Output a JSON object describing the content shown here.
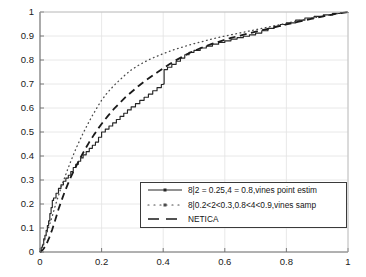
{
  "chart_data": {
    "type": "line",
    "title": "",
    "xlabel": "",
    "ylabel": "",
    "xlim": [
      0,
      1
    ],
    "ylim": [
      0,
      1
    ],
    "grid": true,
    "legend_position": "lower-right",
    "xticks": [
      "0",
      "0.2",
      "0.4",
      "0.6",
      "0.8",
      "1"
    ],
    "xtick_values": [
      0,
      0.2,
      0.4,
      0.6,
      0.8,
      1
    ],
    "yticks": [
      "0",
      "0.1",
      "0.2",
      "0.3",
      "0.4",
      "0.5",
      "0.6",
      "0.7",
      "0.8",
      "0.9",
      "1"
    ],
    "ytick_values": [
      0,
      0.1,
      0.2,
      0.3,
      0.4,
      0.5,
      0.6,
      0.7,
      0.8,
      0.9,
      1
    ],
    "series": [
      {
        "name": "8|2 = 0.25,4 = 0.8,vines point estim",
        "style": "solid",
        "color": "#262626",
        "marker": "dot",
        "x": [
          0.0,
          0.004,
          0.008,
          0.012,
          0.016,
          0.02,
          0.024,
          0.028,
          0.032,
          0.036,
          0.04,
          0.044,
          0.052,
          0.06,
          0.068,
          0.076,
          0.084,
          0.092,
          0.1,
          0.108,
          0.116,
          0.124,
          0.132,
          0.14,
          0.15,
          0.16,
          0.17,
          0.18,
          0.19,
          0.2,
          0.212,
          0.224,
          0.236,
          0.248,
          0.26,
          0.272,
          0.284,
          0.296,
          0.31,
          0.324,
          0.338,
          0.352,
          0.366,
          0.38,
          0.394,
          0.4,
          0.403,
          0.414,
          0.428,
          0.442,
          0.456,
          0.47,
          0.484,
          0.5,
          0.52,
          0.54,
          0.56,
          0.58,
          0.6,
          0.62,
          0.64,
          0.66,
          0.68,
          0.7,
          0.72,
          0.74,
          0.76,
          0.78,
          0.8,
          0.83,
          0.86,
          0.89,
          0.92,
          0.95,
          0.975,
          1.0
        ],
        "y": [
          0.0,
          0.02,
          0.03,
          0.055,
          0.07,
          0.09,
          0.11,
          0.13,
          0.16,
          0.185,
          0.215,
          0.225,
          0.245,
          0.265,
          0.28,
          0.295,
          0.308,
          0.32,
          0.335,
          0.352,
          0.365,
          0.378,
          0.392,
          0.405,
          0.418,
          0.432,
          0.445,
          0.458,
          0.478,
          0.5,
          0.512,
          0.525,
          0.538,
          0.552,
          0.565,
          0.578,
          0.592,
          0.605,
          0.618,
          0.632,
          0.645,
          0.658,
          0.672,
          0.685,
          0.698,
          0.7,
          0.76,
          0.77,
          0.782,
          0.795,
          0.808,
          0.822,
          0.832,
          0.84,
          0.85,
          0.858,
          0.866,
          0.873,
          0.88,
          0.887,
          0.893,
          0.899,
          0.905,
          0.912,
          0.922,
          0.932,
          0.94,
          0.948,
          0.955,
          0.966,
          0.975,
          0.982,
          0.988,
          0.994,
          0.998,
          1.0
        ]
      },
      {
        "name": "8|0.2<2<0.3,0.8<4<0.9,vines samp",
        "style": "dotted",
        "color": "#4a4a4a",
        "x": [
          0.0,
          0.01,
          0.02,
          0.03,
          0.04,
          0.05,
          0.06,
          0.07,
          0.08,
          0.09,
          0.1,
          0.11,
          0.12,
          0.13,
          0.14,
          0.15,
          0.16,
          0.17,
          0.18,
          0.19,
          0.2,
          0.215,
          0.23,
          0.245,
          0.26,
          0.28,
          0.3,
          0.32,
          0.34,
          0.36,
          0.38,
          0.4,
          0.42,
          0.44,
          0.46,
          0.48,
          0.5,
          0.53,
          0.56,
          0.59,
          0.62,
          0.65,
          0.68,
          0.71,
          0.74,
          0.77,
          0.8,
          0.84,
          0.88,
          0.92,
          0.96,
          1.0
        ],
        "y": [
          0.0,
          0.03,
          0.07,
          0.11,
          0.15,
          0.195,
          0.235,
          0.275,
          0.31,
          0.345,
          0.378,
          0.41,
          0.44,
          0.468,
          0.495,
          0.52,
          0.545,
          0.568,
          0.59,
          0.612,
          0.632,
          0.658,
          0.68,
          0.7,
          0.718,
          0.742,
          0.762,
          0.778,
          0.792,
          0.805,
          0.816,
          0.826,
          0.836,
          0.845,
          0.853,
          0.861,
          0.868,
          0.878,
          0.888,
          0.897,
          0.905,
          0.913,
          0.921,
          0.929,
          0.937,
          0.945,
          0.953,
          0.964,
          0.974,
          0.983,
          0.992,
          1.0
        ]
      },
      {
        "name": "NETICA",
        "style": "dashed",
        "color": "#1a1a1a",
        "x": [
          0.0,
          0.01,
          0.02,
          0.03,
          0.04,
          0.05,
          0.06,
          0.07,
          0.08,
          0.09,
          0.1,
          0.115,
          0.13,
          0.145,
          0.16,
          0.175,
          0.19,
          0.205,
          0.22,
          0.24,
          0.26,
          0.28,
          0.3,
          0.32,
          0.34,
          0.36,
          0.38,
          0.4,
          0.42,
          0.44,
          0.46,
          0.48,
          0.5,
          0.53,
          0.56,
          0.59,
          0.62,
          0.65,
          0.68,
          0.71,
          0.74,
          0.77,
          0.8,
          0.84,
          0.88,
          0.92,
          0.96,
          1.0
        ],
        "y": [
          0.0,
          0.01,
          0.03,
          0.06,
          0.095,
          0.135,
          0.178,
          0.215,
          0.25,
          0.282,
          0.312,
          0.352,
          0.39,
          0.425,
          0.458,
          0.488,
          0.516,
          0.542,
          0.566,
          0.596,
          0.622,
          0.648,
          0.67,
          0.692,
          0.712,
          0.73,
          0.748,
          0.765,
          0.782,
          0.798,
          0.812,
          0.826,
          0.838,
          0.854,
          0.868,
          0.88,
          0.892,
          0.902,
          0.912,
          0.921,
          0.93,
          0.939,
          0.948,
          0.96,
          0.971,
          0.982,
          0.992,
          1.0
        ]
      }
    ]
  },
  "legend": {
    "entries": [
      {
        "label": "8|2 = 0.25,4 = 0.8,vines point estim"
      },
      {
        "label": "8|0.2<2<0.3,0.8<4<0.9,vines samp"
      },
      {
        "label": "NETICA"
      }
    ]
  },
  "axes": {
    "x_tick_labels": [
      "0",
      "0.2",
      "0.4",
      "0.6",
      "0.8",
      "1"
    ],
    "y_tick_labels": [
      "1",
      "0.9",
      "0.8",
      "0.7",
      "0.6",
      "0.5",
      "0.4",
      "0.3",
      "0.2",
      "0.1",
      "0"
    ]
  },
  "colors": {
    "axis": "#6e6e6e",
    "grid": "#e2e2e2",
    "solid_series": "#262626",
    "dotted_series": "#4a4a4a",
    "dashed_series": "#1a1a1a",
    "background": "#ffffff"
  }
}
